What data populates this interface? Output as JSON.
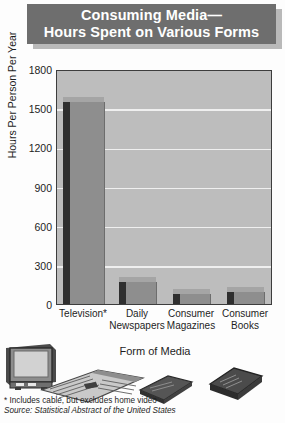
{
  "title": {
    "line1": "Consuming Media—",
    "line2": "Hours Spent on Various Forms"
  },
  "colors": {
    "title_bar": "#6e6e6e",
    "title_text": "#ffffff",
    "plot_background": "#bdbdbd",
    "gridline": "#efefef",
    "bar_front": "#8e8e8e",
    "bar_side": "#2f2f2f",
    "bar_top": "#a5a5a5",
    "axis": "#3d3d3d",
    "page_background": "#fdfdfd"
  },
  "notes": {
    "footnote": "* Includes cable, but excludes home video",
    "source": "Source: Statistical Abstract of the United States"
  },
  "artwork": [
    {
      "name": "television-illustration"
    },
    {
      "name": "newspaper-illustration"
    },
    {
      "name": "magazine-illustration"
    },
    {
      "name": "book-illustration"
    }
  ],
  "chart_data": {
    "type": "bar",
    "xlabel": "Form of Media",
    "ylabel": "Hours Per Person Per Year",
    "categories": [
      "Television*",
      "Daily Newspapers",
      "Consumer Magazines",
      "Consumer Books"
    ],
    "category_lines": [
      [
        "Television*"
      ],
      [
        "Daily",
        "Newspapers"
      ],
      [
        "Consumer",
        "Magazines"
      ],
      [
        "Consumer",
        "Books"
      ]
    ],
    "values": [
      1550,
      170,
      80,
      95
    ],
    "ylim": [
      0,
      1800
    ],
    "yticks": [
      0,
      300,
      600,
      900,
      1200,
      1500,
      1800
    ],
    "ytick_labels": [
      "0",
      "300",
      "600",
      "900",
      "1200",
      "1500",
      "1800"
    ],
    "grid": true,
    "legend": "none",
    "three_d": true,
    "annotations": [
      "* Includes cable, but excludes home video",
      "Source: Statistical Abstract of the United States"
    ]
  }
}
